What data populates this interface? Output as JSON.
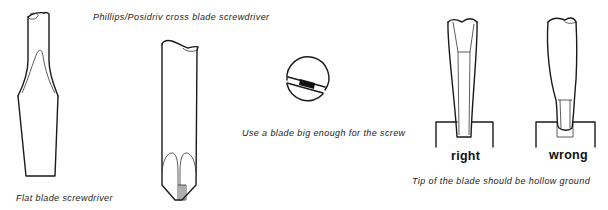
{
  "figure": {
    "flat_blade": {
      "caption": "Flat blade screwdriver"
    },
    "phillips": {
      "caption": "Phillips/Posidriv cross blade screwdriver"
    },
    "screw_head": {
      "caption": "Use a blade big enough for the screw"
    },
    "hollow_ground": {
      "right_label": "right",
      "wrong_label": "wrong",
      "caption": "Tip of the blade should be hollow ground"
    }
  },
  "colors": {
    "line": "#1a1a1a",
    "background": "#ffffff"
  }
}
